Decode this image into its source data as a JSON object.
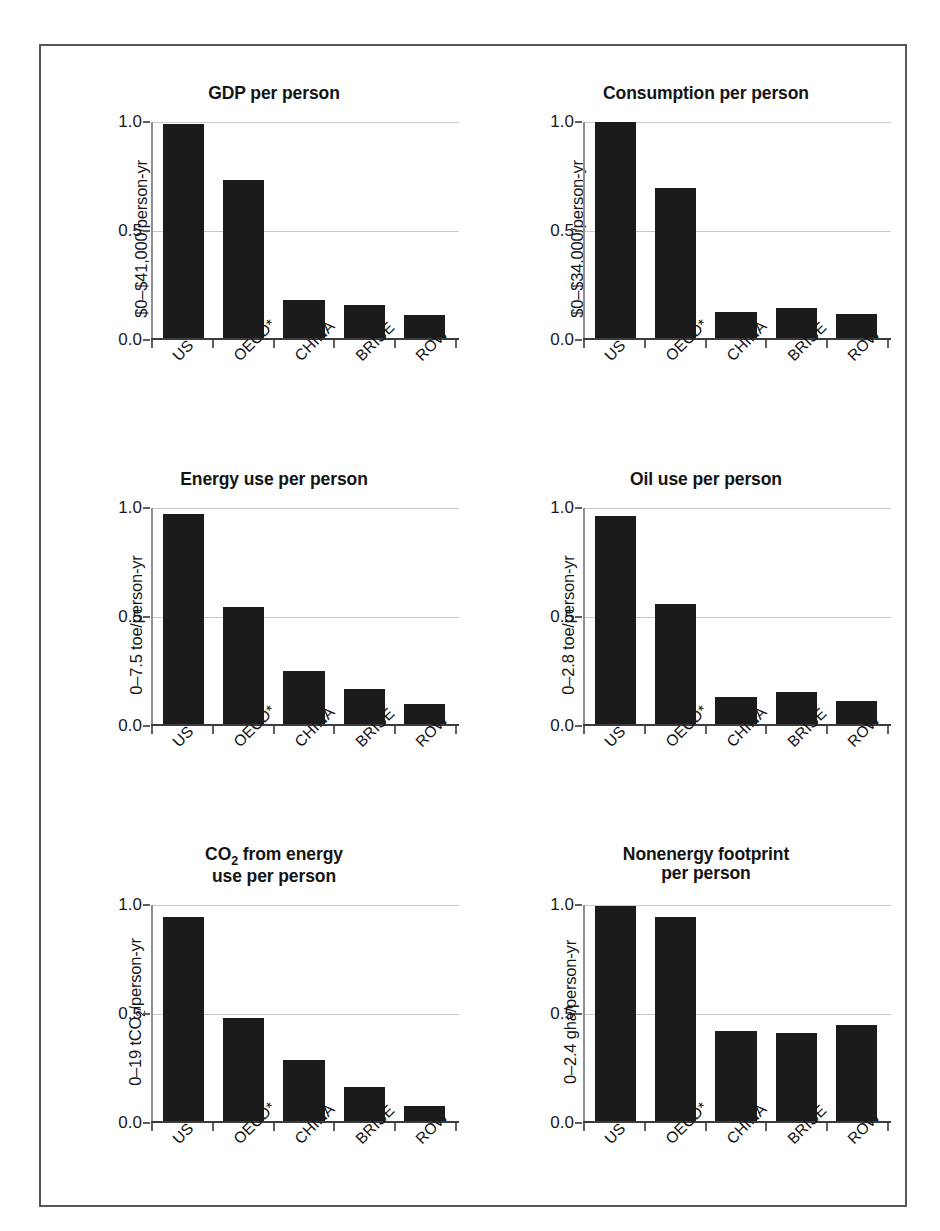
{
  "figure": {
    "categories": [
      "US",
      "OECD*",
      "CHINA",
      "BRISE",
      "ROW"
    ],
    "y_ticks": [
      "0.0",
      "0.5",
      "1.0"
    ],
    "bar_color": "#1b1b1b",
    "grid_color": "#c8cacb",
    "frame_color": "#555759"
  },
  "panels": [
    {
      "id": "gdp-per-person",
      "title": "GDP per person",
      "title_lines": [
        "GDP per person"
      ],
      "ylabel": "$0–$41,000/person-yr",
      "values": [
        0.99,
        0.73,
        0.175,
        0.155,
        0.105
      ]
    },
    {
      "id": "consumption-per-person",
      "title": "Consumption per person",
      "title_lines": [
        "Consumption per person"
      ],
      "ylabel": "$0–$34,000/person-yr",
      "values": [
        1.0,
        0.695,
        0.12,
        0.14,
        0.11
      ]
    },
    {
      "id": "energy-use-per-person",
      "title": "Energy use per person",
      "title_lines": [
        "Energy use per person"
      ],
      "ylabel": "0–7.5 toe/person-yr",
      "values": [
        0.975,
        0.545,
        0.245,
        0.165,
        0.095
      ]
    },
    {
      "id": "oil-use-per-person",
      "title": "Oil use per person",
      "title_lines": [
        "Oil use per person"
      ],
      "ylabel": "0–2.8 toe/person-yr",
      "values": [
        0.965,
        0.555,
        0.125,
        0.15,
        0.11
      ]
    },
    {
      "id": "co2-from-energy-use-per-person",
      "title": "CO2 from energy use per person",
      "title_line1_pre": "CO",
      "title_line1_sub": "2",
      "title_line1_post": " from energy",
      "title_line2": "use per person",
      "ylabel_pre": "0–19 tCO",
      "ylabel_sub": "2",
      "ylabel_post": "/person-yr",
      "values": [
        0.945,
        0.475,
        0.28,
        0.155,
        0.07
      ]
    },
    {
      "id": "nonenergy-footprint-per-person",
      "title": "Nonenergy footprint per person",
      "title_line1": "Nonenergy footprint",
      "title_line2": "per person",
      "ylabel": "0–2.4 gha/person-yr",
      "values": [
        0.995,
        0.945,
        0.415,
        0.405,
        0.445
      ]
    }
  ],
  "chart_data": {
    "type": "bar",
    "categories": [
      "US",
      "OECD*",
      "CHINA",
      "BRISE",
      "ROW"
    ],
    "xlabel": "",
    "ylim": [
      0.0,
      1.0
    ],
    "yticks": [
      0.0,
      0.5,
      1.0
    ],
    "grid": true,
    "legend": "none",
    "panels": [
      {
        "title": "GDP per person",
        "ylabel": "$0–$41,000/person-yr",
        "values": [
          0.99,
          0.73,
          0.175,
          0.155,
          0.105
        ]
      },
      {
        "title": "Consumption per person",
        "ylabel": "$0–$34,000/person-yr",
        "values": [
          1.0,
          0.695,
          0.12,
          0.14,
          0.11
        ]
      },
      {
        "title": "Energy use per person",
        "ylabel": "0–7.5 toe/person-yr",
        "values": [
          0.975,
          0.545,
          0.245,
          0.165,
          0.095
        ]
      },
      {
        "title": "Oil use per person",
        "ylabel": "0–2.8 toe/person-yr",
        "values": [
          0.965,
          0.555,
          0.125,
          0.15,
          0.11
        ]
      },
      {
        "title": "CO2 from energy use per person",
        "ylabel": "0–19 tCO2/person-yr",
        "values": [
          0.945,
          0.475,
          0.28,
          0.155,
          0.07
        ]
      },
      {
        "title": "Nonenergy footprint per person",
        "ylabel": "0–2.4 gha/person-yr",
        "values": [
          0.995,
          0.945,
          0.415,
          0.405,
          0.445
        ]
      }
    ]
  }
}
